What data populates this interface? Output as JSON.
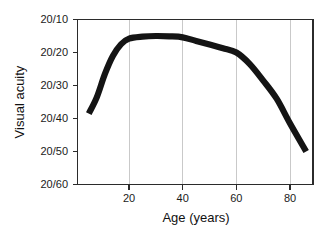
{
  "chart_data": {
    "type": "line",
    "title": "",
    "xlabel": "Age  (years)",
    "ylabel": "Visual acuity",
    "xlim": [
      0,
      89
    ],
    "ylim_labels_top_to_bottom": [
      "20/10",
      "20/20",
      "20/30",
      "20/40",
      "20/50",
      "20/60"
    ],
    "x_tick_labels": [
      "20",
      "40",
      "60",
      "80"
    ],
    "x_tick_values": [
      20,
      40,
      60,
      80
    ],
    "y_tick_labels": [
      "20/10",
      "20/20",
      "20/30",
      "20/40",
      "20/50",
      "20/60"
    ],
    "y_tick_values": [
      10,
      20,
      30,
      40,
      50,
      60
    ],
    "grid": "vertical-only",
    "legend": "none",
    "series": [
      {
        "name": "Visual acuity vs age",
        "x": [
          5,
          8,
          11,
          14,
          17,
          20,
          25,
          30,
          35,
          40,
          45,
          50,
          55,
          60,
          65,
          70,
          75,
          80,
          86
        ],
        "y_denominator": [
          38.5,
          33.5,
          26.5,
          21.0,
          17.5,
          15.8,
          15.2,
          15.0,
          15.1,
          15.4,
          16.5,
          17.6,
          18.7,
          20.0,
          23.5,
          28.5,
          34.0,
          41.5,
          50.0
        ],
        "y_labels": [
          "20/38",
          "20/34",
          "20/27",
          "20/21",
          "20/18",
          "20/16",
          "20/15",
          "20/15",
          "20/15",
          "20/15",
          "20/17",
          "20/18",
          "20/19",
          "20/20",
          "20/24",
          "20/29",
          "20/34",
          "20/42",
          "20/50"
        ]
      }
    ],
    "annotations": []
  },
  "axes": {
    "y_axis_title": "Visual acuity",
    "x_axis_title": "Age  (years)",
    "y_labels": [
      "20/10",
      "20/20",
      "20/30",
      "20/40",
      "20/50",
      "20/60"
    ],
    "x_labels": [
      "20",
      "40",
      "60",
      "80"
    ]
  },
  "colors": {
    "curve": "#141414",
    "gridline": "#c9c9c9",
    "frame": "#2b2b2b",
    "text": "#111111",
    "background": "#ffffff"
  }
}
